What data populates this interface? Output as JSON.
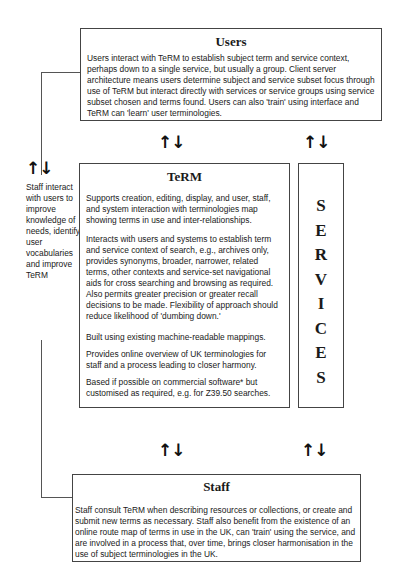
{
  "users": {
    "title": "Users",
    "text": "Users interact with TeRM to establish subject term and service context, perhaps down to a single service, but usually a group. Client server architecture means users determine subject and service subset focus through use of TeRM but interact directly with services or service groups using service subset chosen and terms found. Users can also 'train' using interface and TeRM can 'learn' user terminologies."
  },
  "term": {
    "title": "TeRM",
    "paragraphs": [
      "Supports creation, editing, display, and user, staff, and system interaction with terminologies map showing terms in use and inter-relationships.",
      "Interacts with users and systems to establish term and service context of search, e.g., archives only, provides synonyms, broader, narrower, related terms, other contexts and service-set navigational aids for cross searching and browsing as required. Also permits greater precision or greater recall decisions to be made. Flexibility of approach should reduce likelihood of 'dumbing down.'",
      "Built using existing machine-readable mappings.",
      "Provides online overview of UK terminologies for staff and a process leading to closer harmony.",
      "Based if possible on commercial software* but customised as required, e.g. for Z39.50 searches."
    ]
  },
  "services": {
    "letters": [
      "S",
      "E",
      "R",
      "V",
      "I",
      "C",
      "E",
      "S"
    ]
  },
  "staff": {
    "title": "Staff",
    "text": "Staff consult TeRM when describing resources or collections, or create and submit new terms as necessary. Staff also benefit from the existence of an online route map of terms in use in the UK, can 'train' using the service, and are involved in a process that, over time, brings closer harmonisation in the use of subject terminologies in the UK."
  },
  "side_note": {
    "text": "Staff interact with users to improve knowledge of needs, identify user vocabularies and improve TeRM"
  },
  "arrows": {
    "glyph": "🡹🡻",
    "up": "↑",
    "down": "↓"
  }
}
